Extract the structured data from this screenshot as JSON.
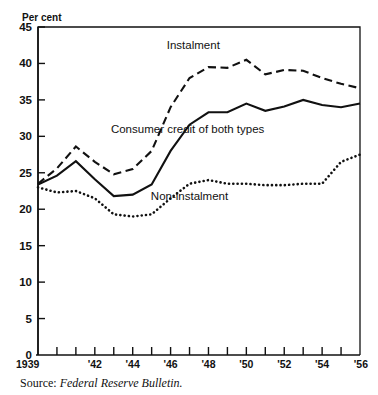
{
  "figure": {
    "unit_label": "Per cent",
    "source_prefix": "Source:",
    "source_publication": "Federal Reserve Bulletin."
  },
  "chart_data": {
    "type": "line",
    "title": "",
    "subtitle": "",
    "xlabel": "",
    "ylabel": "Per cent",
    "ylim": [
      0,
      45
    ],
    "xlim": [
      1939,
      1956
    ],
    "grid": false,
    "legend_position": "inline-annotations",
    "y_ticks": [
      0,
      5,
      10,
      15,
      20,
      25,
      30,
      35,
      40,
      45
    ],
    "y_tick_labels": [
      "0",
      "5",
      "10",
      "15",
      "20",
      "25",
      "30",
      "35",
      "40",
      "45"
    ],
    "x": [
      1939,
      1940,
      1941,
      1942,
      1943,
      1944,
      1945,
      1946,
      1947,
      1948,
      1949,
      1950,
      1951,
      1952,
      1953,
      1954,
      1955,
      1956
    ],
    "x_tick_labels": [
      "1939",
      "",
      "",
      "'42",
      "",
      "'44",
      "",
      "'46",
      "",
      "'48",
      "",
      "'50",
      "",
      "'52",
      "",
      "'54",
      "",
      "'56"
    ],
    "series": [
      {
        "name": "Instalment",
        "style": "dashed",
        "label_text": "Instalment",
        "values": [
          23.5,
          25.6,
          28.6,
          26.5,
          24.8,
          25.5,
          28.0,
          34.0,
          38.0,
          39.5,
          39.4,
          40.5,
          38.5,
          39.1,
          39.0,
          38.0,
          37.2,
          36.6
        ]
      },
      {
        "name": "Consumer credit of both types",
        "style": "solid",
        "label_text": "Consumer credit of both types",
        "values": [
          23.4,
          24.6,
          26.6,
          24.1,
          21.8,
          22.0,
          23.4,
          28.0,
          31.6,
          33.3,
          33.3,
          34.5,
          33.5,
          34.1,
          35.0,
          34.3,
          34.0,
          34.5
        ]
      },
      {
        "name": "Non-instalment",
        "style": "dotted",
        "label_text": "Non-instalment",
        "values": [
          23.0,
          22.3,
          22.5,
          21.5,
          19.3,
          19.0,
          19.3,
          21.5,
          23.5,
          24.0,
          23.5,
          23.5,
          23.3,
          23.3,
          23.5,
          23.5,
          26.5,
          27.5
        ]
      }
    ],
    "annotations": [
      {
        "text": "Instalment",
        "x": 1947.2,
        "y": 42.0
      },
      {
        "text": "Consumer credit of both types",
        "x": 1946.9,
        "y": 30.4
      },
      {
        "text": "Non-instalment",
        "x": 1947.0,
        "y": 21.2
      }
    ],
    "colors": {
      "ink": "#111111",
      "background": "#ffffff"
    }
  }
}
